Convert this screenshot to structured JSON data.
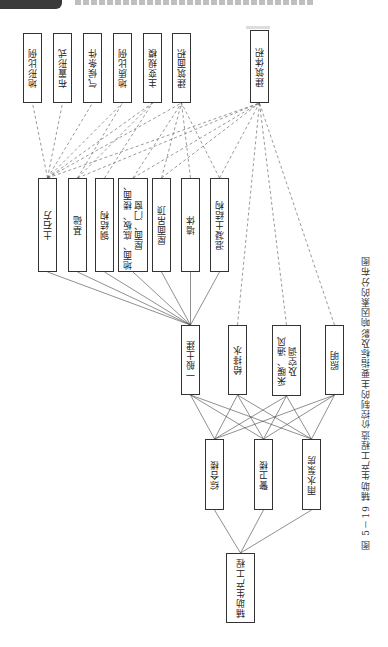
{
  "caption": "图 5－19  辅助生产工程造价控制的主要指标及影响因素的分布图",
  "root": {
    "id": "root",
    "label": "辅助生产工程",
    "x": 226,
    "y": 553,
    "w": 29,
    "h": 70
  },
  "buildings": [
    {
      "id": "b1",
      "label": "综合楼",
      "x": 205,
      "y": 439,
      "w": 19,
      "h": 71
    },
    {
      "id": "b2",
      "label": "警卫楼",
      "x": 254,
      "y": 439,
      "w": 19,
      "h": 71
    },
    {
      "id": "b3",
      "label": "雨水泵房",
      "x": 302,
      "y": 439,
      "w": 19,
      "h": 71
    }
  ],
  "disciplines": [
    {
      "id": "d1",
      "label": "一般土建",
      "x": 181,
      "y": 325,
      "w": 19,
      "h": 70
    },
    {
      "id": "d2",
      "label": "给排水",
      "x": 228,
      "y": 325,
      "w": 19,
      "h": 70
    },
    {
      "id": "d3",
      "label": "采暖、通风\n及空调",
      "x": 272,
      "y": 325,
      "w": 29,
      "h": 71
    },
    {
      "id": "d4",
      "label": "照明",
      "x": 325,
      "y": 325,
      "w": 19,
      "h": 70
    }
  ],
  "items": [
    {
      "id": "i1",
      "label": "土石方",
      "x": 38,
      "y": 178,
      "w": 19,
      "h": 94
    },
    {
      "id": "i2",
      "label": "基础",
      "x": 68,
      "y": 178,
      "w": 19,
      "h": 94
    },
    {
      "id": "i3",
      "label": "钢结构",
      "x": 95,
      "y": 178,
      "w": 19,
      "h": 94
    },
    {
      "id": "i4",
      "label": "地面、底板、楼面、\n屋面、门窗",
      "x": 118,
      "y": 178,
      "w": 30,
      "h": 94
    },
    {
      "id": "i5",
      "label": "屋面吊顶",
      "x": 152,
      "y": 178,
      "w": 19,
      "h": 94
    },
    {
      "id": "i6",
      "label": "墙体",
      "x": 181,
      "y": 178,
      "w": 19,
      "h": 94
    },
    {
      "id": "i7",
      "label": "混凝土结构",
      "x": 210,
      "y": 178,
      "w": 19,
      "h": 94
    }
  ],
  "factors": [
    {
      "id": "f1",
      "label": "地形比例",
      "x": 23,
      "y": 33,
      "w": 19,
      "h": 70
    },
    {
      "id": "f2",
      "label": "布置形式",
      "x": 53,
      "y": 33,
      "w": 19,
      "h": 70
    },
    {
      "id": "f3",
      "label": "气候条件",
      "x": 83,
      "y": 33,
      "w": 19,
      "h": 70
    },
    {
      "id": "f4",
      "label": "地质比例",
      "x": 113,
      "y": 33,
      "w": 19,
      "h": 70
    },
    {
      "id": "f5",
      "label": "主变规模",
      "x": 143,
      "y": 33,
      "w": 19,
      "h": 70
    },
    {
      "id": "f6",
      "label": "建筑面积",
      "x": 172,
      "y": 33,
      "w": 19,
      "h": 70
    },
    {
      "id": "f7",
      "label": "建筑体积",
      "x": 250,
      "y": 30,
      "w": 19,
      "h": 73
    }
  ],
  "solid_edges": [
    [
      "root",
      "b1"
    ],
    [
      "root",
      "b2"
    ],
    [
      "root",
      "b3"
    ],
    [
      "b1",
      "d1"
    ],
    [
      "b1",
      "d2"
    ],
    [
      "b1",
      "d3"
    ],
    [
      "b1",
      "d4"
    ],
    [
      "b2",
      "d1"
    ],
    [
      "b2",
      "d2"
    ],
    [
      "b2",
      "d3"
    ],
    [
      "b2",
      "d4"
    ],
    [
      "b3",
      "d1"
    ],
    [
      "b3",
      "d2"
    ],
    [
      "b3",
      "d3"
    ],
    [
      "b3",
      "d4"
    ],
    [
      "d1",
      "i1"
    ],
    [
      "d1",
      "i2"
    ],
    [
      "d1",
      "i3"
    ],
    [
      "d1",
      "i4"
    ],
    [
      "d1",
      "i5"
    ],
    [
      "d1",
      "i6"
    ],
    [
      "d1",
      "i7"
    ]
  ],
  "dashed_edges": [
    [
      "f1",
      "i1"
    ],
    [
      "f2",
      "i1"
    ],
    [
      "f3",
      "i1"
    ],
    [
      "f4",
      "i1"
    ],
    [
      "f5",
      "i1"
    ],
    [
      "f6",
      "i1"
    ],
    [
      "f4",
      "i2"
    ],
    [
      "f5",
      "i2"
    ],
    [
      "f5",
      "i3"
    ],
    [
      "f6",
      "i4"
    ],
    [
      "f6",
      "i5"
    ],
    [
      "f6",
      "i6"
    ],
    [
      "f6",
      "i7"
    ],
    [
      "f7",
      "i1"
    ],
    [
      "f7",
      "i2"
    ],
    [
      "f7",
      "i4"
    ],
    [
      "f7",
      "i5"
    ],
    [
      "f7",
      "i7"
    ],
    [
      "f7",
      "d2"
    ],
    [
      "f7",
      "d3"
    ],
    [
      "f7",
      "d4"
    ]
  ]
}
